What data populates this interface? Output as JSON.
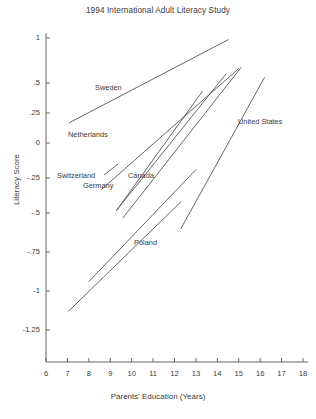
{
  "chart_data": {
    "type": "line",
    "title": "1994 International Adult Literacy Study",
    "xlabel": "Parents' Education (Years)",
    "ylabel": "Literacy Score",
    "grid": false,
    "legend_position": "inline-annotations",
    "xlim": [
      6,
      18
    ],
    "ylim": [
      -1.3,
      1.05
    ],
    "xticks": [
      6,
      7,
      8,
      9,
      10,
      11,
      12,
      13,
      14,
      15,
      16,
      17,
      18
    ],
    "xtick_labels": [
      "6",
      "7",
      "8",
      "9",
      "10",
      "11",
      "12",
      "13",
      "14",
      "15",
      "16",
      "17",
      "18"
    ],
    "yticks": [
      1,
      0.5,
      0.25,
      0,
      -0.25,
      -0.5,
      -0.75,
      -1,
      -1.25
    ],
    "ytick_labels": [
      "1",
      ".5",
      ".25",
      "0",
      "-.25",
      "-.5",
      "-.75",
      "-1",
      "-1.25"
    ],
    "series": [
      {
        "name": "Sweden",
        "label": "Sweden",
        "x": [
          7.1,
          14.5
        ],
        "y": [
          0.17,
          0.98
        ],
        "label_x": 95,
        "label_y": 83
      },
      {
        "name": "Netherlands",
        "label": "Netherlands",
        "x": [
          8.6,
          15.0
        ],
        "y": [
          -0.33,
          0.66
        ],
        "label_x": 68,
        "label_y": 130
      },
      {
        "name": "Switzerland",
        "label": "Switzerland",
        "x": [
          9.3,
          14.4
        ],
        "y": [
          -0.48,
          0.6
        ],
        "label_x": 57,
        "label_y": 171
      },
      {
        "name": "Germany",
        "label": "Germany",
        "x": [
          9.3,
          13.3
        ],
        "y": [
          -0.48,
          0.43
        ],
        "label_x": 83,
        "label_y": 181
      },
      {
        "name": "Canada",
        "label": "Canada",
        "x": [
          9.6,
          15.1
        ],
        "y": [
          -0.53,
          0.67
        ],
        "label_x": 128,
        "label_y": 171
      },
      {
        "name": "United States",
        "label": "United States",
        "x": [
          12.3,
          16.2
        ],
        "y": [
          -0.6,
          0.56
        ],
        "label_x": 238,
        "label_y": 117
      },
      {
        "name": "Poland",
        "label": "Poland",
        "x": [
          8.0,
          13.0
        ],
        "y": [
          -0.94,
          -0.19
        ],
        "label_x": 134,
        "label_y": 238
      },
      {
        "name": "Unlabeled-low",
        "label": "",
        "x": [
          7.05,
          12.3
        ],
        "y": [
          -1.13,
          -0.42
        ],
        "label_x": 0,
        "label_y": 0
      }
    ]
  },
  "axis_geometry": {
    "x_px": {
      "6": 46,
      "18": 303
    },
    "y_px": {
      "1": 38,
      "0.5": 83,
      "0.25": 113,
      "0": 143,
      "-0.25": 178,
      "-0.5": 213,
      "-0.75": 252,
      "-1": 291,
      "-1.25": 330
    },
    "axis_color": "#555555",
    "line_color": "#4a4a4a"
  }
}
